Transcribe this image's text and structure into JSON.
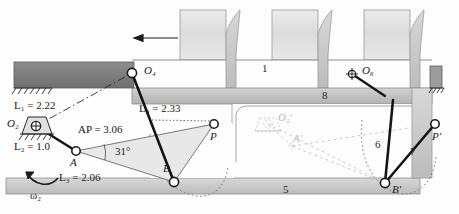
{
  "figure": {
    "type": "mechanism-diagram"
  },
  "dimensions": {
    "L1": "L₁ = 2.22",
    "L2": "L₂ = 1.0",
    "L3": "L₃ = 2.06",
    "L4": "L₄ = 2.33",
    "AP": "AP = 3.06",
    "angle": "31°"
  },
  "joints": {
    "O2": "O₂",
    "O4": "O₄",
    "O6": "O₆",
    "A": "A",
    "B": "B",
    "P": "P",
    "O2p": "O₂′",
    "Ap": "A′",
    "Bp": "B′",
    "Pp": "P′"
  },
  "links": {
    "one": "1",
    "five": "5",
    "six": "6",
    "seven": "7",
    "eight": "8"
  },
  "input": {
    "omega": "ω₂"
  },
  "colors": {
    "beam_dark": "#7b7b7b",
    "beam_light": "#c9c9c9",
    "band": "#bfbfbf",
    "box_fill": "#e2e2e2",
    "coupler_fill": "#e6e6e6",
    "link_stroke": "#151515",
    "ghost": "#c2c2c2",
    "paper": "#fdfdfd"
  }
}
